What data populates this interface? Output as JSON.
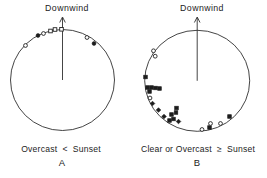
{
  "figure": {
    "background_color": "#ffffff",
    "ink_color": "#1c1c1c"
  },
  "chart_data": {
    "type": "scatter",
    "subtype": "circular-orientation-diagram",
    "description_of_axes": "angle_deg measured from Downwind arrow (0 = downwind, positive clockwise)",
    "diagrams": [
      {
        "letter": "A",
        "arrow_label": "Downwind",
        "caption": "Overcast  <  Sunset",
        "center": {
          "x": 62.5,
          "y": 80
        },
        "radius": {
          "rx": 52,
          "ry": 50.5
        },
        "arrow": {
          "to_y": 17
        },
        "points": [
          {
            "x": 25.5,
            "y": 45.5,
            "symbol": "open-circle",
            "angle_deg": -47
          },
          {
            "x": 38,
            "y": 35.5,
            "symbol": "filled-circle",
            "angle_deg": -29
          },
          {
            "x": 43.5,
            "y": 33.5,
            "symbol": "open-circle",
            "angle_deg": -22
          },
          {
            "x": 50.5,
            "y": 31,
            "symbol": "open-square",
            "angle_deg": -14
          },
          {
            "x": 55,
            "y": 29.5,
            "symbol": "open-square",
            "angle_deg": -8
          },
          {
            "x": 61.5,
            "y": 29.3,
            "symbol": "open-square",
            "angle_deg": -1
          },
          {
            "x": 87,
            "y": 37.5,
            "symbol": "open-circle",
            "angle_deg": 30
          },
          {
            "x": 94,
            "y": 43.5,
            "symbol": "filled-circle",
            "angle_deg": 41
          }
        ]
      },
      {
        "letter": "B",
        "arrow_label": "Downwind",
        "caption": "Clear or Overcast  ≥  Sunset",
        "center": {
          "x": 197.2,
          "y": 80.8
        },
        "radius": {
          "rx": 52.5,
          "ry": 50.5
        },
        "arrow": {
          "to_y": 17
        },
        "points": [
          {
            "x": 153.5,
            "y": 50.8,
            "symbol": "open-circle",
            "angle_deg": -55
          },
          {
            "x": 155.2,
            "y": 56.2,
            "symbol": "open-circle",
            "angle_deg": -59
          },
          {
            "x": 145.5,
            "y": 77,
            "symbol": "filled-square",
            "angle_deg": -86
          },
          {
            "x": 147.5,
            "y": 87.5,
            "symbol": "filled-square",
            "angle_deg": -98
          },
          {
            "x": 151.5,
            "y": 87.5,
            "symbol": "filled-square",
            "angle_deg": -97
          },
          {
            "x": 155.5,
            "y": 88,
            "symbol": "filled-square",
            "angle_deg": -97
          },
          {
            "x": 159.5,
            "y": 88.5,
            "symbol": "filled-square",
            "angle_deg": -97
          },
          {
            "x": 149.5,
            "y": 91.5,
            "symbol": "filled-square",
            "angle_deg": -103
          },
          {
            "x": 150,
            "y": 98,
            "symbol": "open-circle",
            "angle_deg": -110
          },
          {
            "x": 152.5,
            "y": 103.5,
            "symbol": "filled-diamond",
            "angle_deg": -117
          },
          {
            "x": 158.5,
            "y": 110,
            "symbol": "filled-diamond",
            "angle_deg": -127
          },
          {
            "x": 164,
            "y": 116.5,
            "symbol": "filled-diamond",
            "angle_deg": -137
          },
          {
            "x": 171.5,
            "y": 114.5,
            "symbol": "filled-square",
            "angle_deg": -142
          },
          {
            "x": 176.5,
            "y": 108,
            "symbol": "filled-square",
            "angle_deg": -143
          },
          {
            "x": 176,
            "y": 112.5,
            "symbol": "filled-square",
            "angle_deg": -146
          },
          {
            "x": 169.5,
            "y": 120.5,
            "symbol": "filled-square",
            "angle_deg": -145
          },
          {
            "x": 173.5,
            "y": 119,
            "symbol": "filled-square",
            "angle_deg": -147
          },
          {
            "x": 178.5,
            "y": 121.5,
            "symbol": "filled-diamond",
            "angle_deg": -153
          },
          {
            "x": 202,
            "y": 129.5,
            "symbol": "open-circle",
            "angle_deg": 174
          },
          {
            "x": 209.5,
            "y": 127.5,
            "symbol": "filled-square",
            "angle_deg": 165
          },
          {
            "x": 210.5,
            "y": 123.5,
            "symbol": "open-circle",
            "angle_deg": 163
          },
          {
            "x": 220.5,
            "y": 123.5,
            "symbol": "open-circle",
            "angle_deg": 151
          },
          {
            "x": 229.5,
            "y": 116.5,
            "symbol": "filled-square",
            "angle_deg": 138
          }
        ]
      }
    ]
  }
}
